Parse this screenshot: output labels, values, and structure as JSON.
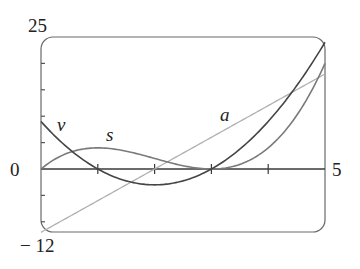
{
  "chart_data": {
    "type": "line",
    "title": "",
    "xlabel": "",
    "ylabel": "",
    "xlim": [
      0,
      5
    ],
    "ylim": [
      -12,
      25
    ],
    "grid": false,
    "legend": "inline labels",
    "axis_tick_labels": {
      "x_min": "0",
      "x_max": "5",
      "y_max": "25",
      "y_min": "− 12"
    },
    "x_ticks": [
      1,
      2,
      3,
      4
    ],
    "y_ticks": [
      -10,
      -5,
      5,
      10,
      15,
      20
    ],
    "x": [
      0,
      0.5,
      1,
      1.5,
      2,
      2.5,
      3,
      3.5,
      4,
      4.5,
      5
    ],
    "series": [
      {
        "name": "s",
        "formula": "t^3 - 6t^2 + 9t",
        "color": "#7a7a7a",
        "values": [
          0,
          3.125,
          4,
          3.375,
          2,
          0.625,
          0,
          0.875,
          4,
          10.125,
          20
        ]
      },
      {
        "name": "v",
        "formula": "3t^2 - 12t + 9",
        "color": "#454545",
        "values": [
          9,
          3.75,
          0,
          -2.25,
          -3,
          -2.25,
          0,
          3.75,
          9,
          15.75,
          24
        ]
      },
      {
        "name": "a",
        "formula": "6t - 12",
        "color": "#b0b0b0",
        "values": [
          -12,
          -9,
          -6,
          -3,
          0,
          3,
          6,
          9,
          12,
          15,
          18
        ]
      }
    ],
    "annotations": [
      {
        "text": "v",
        "near_series": "v"
      },
      {
        "text": "s",
        "near_series": "s"
      },
      {
        "text": "a",
        "near_series": "a"
      }
    ]
  }
}
